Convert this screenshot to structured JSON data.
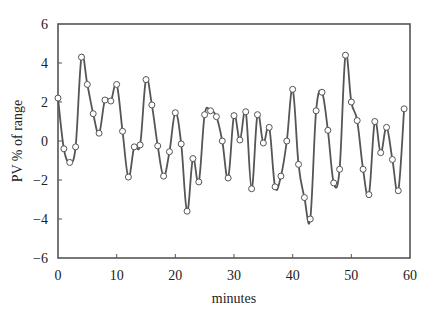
{
  "chart_data": {
    "type": "line",
    "title": "",
    "xlabel": "minutes",
    "ylabel": "PV % of range",
    "xlim": [
      0,
      60
    ],
    "ylim": [
      -6,
      6
    ],
    "xticks": [
      0,
      10,
      20,
      30,
      40,
      50,
      60
    ],
    "yticks": [
      -6,
      -4,
      -2,
      0,
      2,
      4,
      6
    ],
    "ytick_labels": [
      "−6",
      "−4",
      "−2",
      "0",
      "2",
      "4",
      "6"
    ],
    "grid": false,
    "legend": null,
    "marker": "open-circle",
    "line_color": "#555555",
    "series": [
      {
        "name": "PV",
        "x": [
          0,
          1,
          2,
          3,
          4,
          5,
          6,
          7,
          8,
          9,
          10,
          11,
          12,
          13,
          14,
          15,
          16,
          17,
          18,
          19,
          20,
          21,
          22,
          23,
          24,
          25,
          26,
          27,
          28,
          29,
          30,
          31,
          32,
          33,
          34,
          35,
          36,
          37,
          38,
          39,
          40,
          41,
          42,
          43,
          44,
          45,
          46,
          47,
          48,
          49,
          50,
          51,
          52,
          53,
          54,
          55,
          56,
          57,
          58,
          59
        ],
        "values": [
          2.2,
          -0.4,
          -1.1,
          -0.3,
          4.3,
          2.9,
          1.4,
          0.4,
          2.1,
          2.05,
          2.9,
          0.5,
          -1.85,
          -0.3,
          -0.2,
          3.15,
          1.85,
          -0.25,
          -1.8,
          -0.55,
          1.45,
          -0.15,
          -3.6,
          -0.9,
          -2.1,
          1.35,
          1.55,
          1.25,
          0.0,
          -1.9,
          1.3,
          0.05,
          1.5,
          -2.45,
          1.35,
          -0.1,
          0.7,
          -2.35,
          -1.8,
          0.0,
          2.65,
          -1.2,
          -2.9,
          -4.0,
          1.55,
          2.5,
          0.55,
          -2.15,
          -1.45,
          4.4,
          2.0,
          1.05,
          -1.45,
          -2.75,
          1.0,
          -0.6,
          0.7,
          -0.95,
          -2.55,
          1.65
        ]
      }
    ]
  }
}
